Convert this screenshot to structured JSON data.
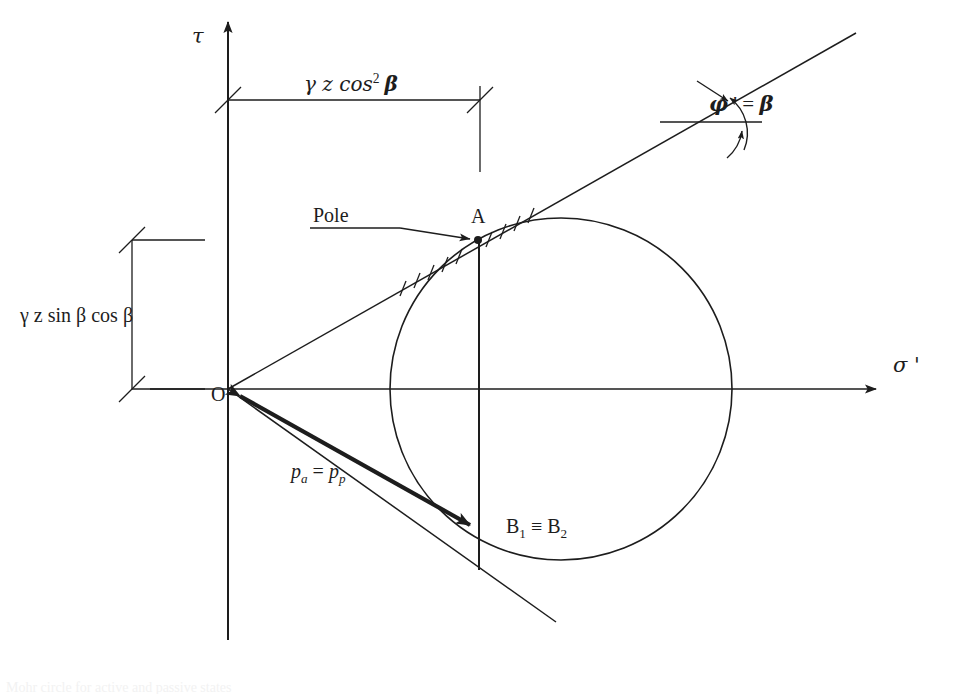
{
  "figure": {
    "type": "mohr-circle-stress-diagram",
    "background_color": "#ffffff",
    "line_color": "#1d1d1d",
    "caption_fragment": "Mohr circle for active and passive states"
  },
  "axes": {
    "vertical": {
      "name": "shear-stress-axis",
      "label": "τ",
      "label_plain": "tau",
      "arrow": "up",
      "x": 228,
      "top_y": 18,
      "bottom_y": 640
    },
    "horizontal": {
      "name": "effective-normal-stress-axis",
      "label": "σ '",
      "label_plain": "sigma prime",
      "arrow": "right",
      "y": 389,
      "left_x": 150,
      "right_x": 880
    }
  },
  "dimensions": {
    "horizontal": {
      "label_prefix": "γ z cos",
      "label_exponent": "2",
      "label_suffix": "β",
      "label_plain": "gamma z cos^2 beta",
      "from_x": 228,
      "to_x": 480,
      "y": 100
    },
    "vertical": {
      "label": "γ z sin β cos β",
      "label_plain": "gamma z sin beta cos beta",
      "x": 132,
      "from_y": 240,
      "to_y": 389
    }
  },
  "points": {
    "origin": {
      "label": "O",
      "x": 228,
      "y": 389
    },
    "pole": {
      "label": "A",
      "callout": "Pole",
      "x": 478,
      "y": 240
    },
    "b_point": {
      "label_first": "B",
      "label_first_sub": "1",
      "label_separator": "≡",
      "label_second": "B",
      "label_second_sub": "2",
      "label_plain": "B1 = B2",
      "x": 479,
      "y": 530
    }
  },
  "circle": {
    "name": "mohr-circle",
    "center_x": 561,
    "center_y": 389,
    "radius": 171
  },
  "annotations": {
    "pressure_vector": {
      "label_first": "p",
      "label_first_sub": "a",
      "label_equals": "=",
      "label_second": "p",
      "label_second_sub": "p",
      "label_plain": "pa = pp",
      "from_x": 228,
      "from_y": 389,
      "to_x": 479,
      "to_y": 530,
      "double_headed": true
    },
    "friction_angle": {
      "label_phi": "φ",
      "label_prime": "'",
      "label_equals": "=",
      "label_beta": "β",
      "label_plain": "phi' = beta",
      "vertex_x": 740,
      "vertex_y": 122
    }
  },
  "lines": {
    "failure_envelope_upper": {
      "name": "upper-failure-line",
      "from_x": 228,
      "from_y": 389,
      "to_x": 856,
      "to_y": 33
    },
    "failure_envelope_lower": {
      "name": "lower-conjugate-line",
      "from_x": 228,
      "from_y": 389,
      "to_x": 556,
      "to_y": 622
    },
    "vertical_chord": {
      "name": "chord-a-b",
      "x": 479,
      "from_y": 238,
      "to_y": 570
    },
    "angle_reference": {
      "name": "angle-reference-horizontal",
      "y": 122,
      "from_x": 660,
      "to_x": 762
    }
  }
}
